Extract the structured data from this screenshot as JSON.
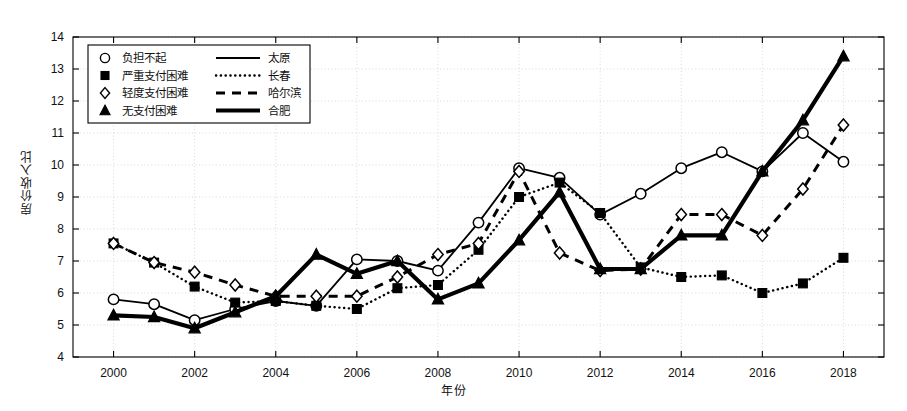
{
  "chart_data": {
    "type": "line",
    "title": "",
    "xlabel": "年份",
    "ylabel": "房价收入比",
    "xlim": [
      1999,
      2019
    ],
    "ylim": [
      4,
      14
    ],
    "ytick_step": 1,
    "xtick_step": 2,
    "grid": true,
    "legend_position": "upper-left",
    "x": [
      2000,
      2001,
      2002,
      2003,
      2004,
      2005,
      2006,
      2007,
      2008,
      2009,
      2010,
      2011,
      2012,
      2013,
      2014,
      2015,
      2016,
      2017,
      2018
    ],
    "xticklabels": [
      "2000",
      "2002",
      "2004",
      "2006",
      "2008",
      "2010",
      "2012",
      "2014",
      "2016",
      "2018"
    ],
    "yticklabels": [
      "4",
      "5",
      "6",
      "7",
      "8",
      "9",
      "10",
      "11",
      "12",
      "13",
      "14"
    ],
    "series": [
      {
        "name": "太原",
        "category": "负担不起",
        "marker": "circle",
        "linestyle": "solid",
        "color": "#000000",
        "values": [
          5.8,
          5.65,
          5.15,
          5.5,
          5.75,
          5.6,
          7.05,
          7.0,
          6.7,
          8.2,
          9.9,
          9.6,
          8.45,
          9.1,
          9.9,
          10.4,
          9.8,
          11.0,
          10.1
        ]
      },
      {
        "name": "长春",
        "category": "严重支付困难",
        "marker": "square",
        "linestyle": "dotted",
        "color": "#000000",
        "values": [
          7.55,
          6.95,
          6.2,
          5.7,
          5.75,
          5.6,
          5.5,
          6.15,
          6.25,
          7.35,
          9.0,
          9.45,
          8.5,
          6.8,
          6.5,
          6.55,
          6.0,
          6.3,
          7.1
        ]
      },
      {
        "name": "哈尔滨",
        "category": "轻度支付困难",
        "marker": "diamond",
        "linestyle": "dashed",
        "color": "#000000",
        "values": [
          7.55,
          6.95,
          6.65,
          6.25,
          5.9,
          5.9,
          5.9,
          6.5,
          7.2,
          7.55,
          9.8,
          7.25,
          6.7,
          6.75,
          8.45,
          8.45,
          7.8,
          9.25,
          11.25
        ]
      },
      {
        "name": "合肥",
        "category": "无支付困难",
        "marker": "triangle",
        "linestyle": "thick-solid",
        "color": "#000000",
        "values": [
          5.3,
          5.25,
          4.9,
          5.4,
          5.9,
          7.2,
          6.6,
          7.0,
          5.8,
          6.3,
          7.65,
          9.15,
          6.75,
          6.75,
          7.8,
          7.8,
          9.8,
          11.4,
          13.4
        ]
      }
    ],
    "legend": [
      {
        "category": "负担不起",
        "city": "太原",
        "marker": "circle",
        "linestyle": "solid"
      },
      {
        "category": "严重支付困难",
        "city": "长春",
        "marker": "square",
        "linestyle": "dotted"
      },
      {
        "category": "轻度支付困难",
        "city": "哈尔滨",
        "marker": "diamond",
        "linestyle": "dashed"
      },
      {
        "category": "无支付困难",
        "city": "合肥",
        "marker": "triangle",
        "linestyle": "thick-solid"
      }
    ]
  }
}
